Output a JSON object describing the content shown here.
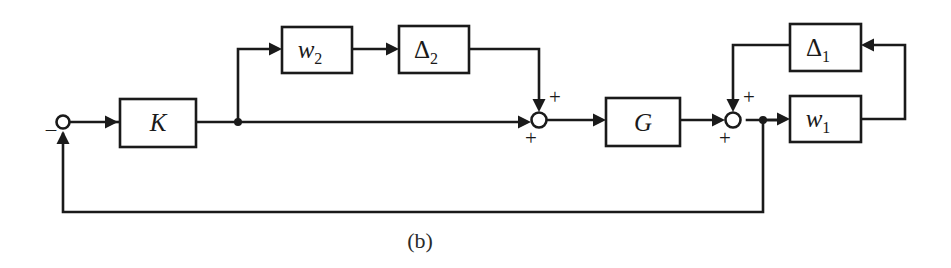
{
  "figure": {
    "caption": "(b)",
    "caption_x": 420,
    "caption_y": 248,
    "width": 951,
    "height": 268,
    "background_color": "#ffffff",
    "line_color": "#1a1a1a"
  },
  "blocks": [
    {
      "id": "controller",
      "name": "K",
      "label_main": "K",
      "label_sub": "",
      "italic": true,
      "x": 120,
      "y": 99,
      "w": 76,
      "h": 48,
      "label_x": 158,
      "label_y": 131
    },
    {
      "id": "weight2",
      "name": "w2",
      "label_main": "w",
      "label_sub": "2",
      "italic": true,
      "x": 282,
      "y": 27,
      "w": 70,
      "h": 46,
      "label_x": 310,
      "label_y": 58
    },
    {
      "id": "delta2",
      "name": "Delta2",
      "label_main": "Δ",
      "label_sub": "2",
      "italic": false,
      "x": 399,
      "y": 26,
      "w": 70,
      "h": 47,
      "label_x": 426,
      "label_y": 58
    },
    {
      "id": "plant",
      "name": "G",
      "label_main": "G",
      "label_sub": "",
      "italic": true,
      "x": 606,
      "y": 98,
      "w": 74,
      "h": 48,
      "label_x": 643,
      "label_y": 131
    },
    {
      "id": "delta1",
      "name": "Delta1",
      "label_main": "Δ",
      "label_sub": "1",
      "italic": false,
      "x": 790,
      "y": 24,
      "w": 71,
      "h": 47,
      "label_x": 818,
      "label_y": 56
    },
    {
      "id": "weight1",
      "name": "w1",
      "label_main": "w",
      "label_sub": "1",
      "italic": true,
      "x": 790,
      "y": 96,
      "w": 71,
      "h": 46,
      "label_x": 818,
      "label_y": 127
    }
  ],
  "summing_junctions": [
    {
      "id": "error-junction",
      "name": "error-summing-junction",
      "cx": 63,
      "cy": 122,
      "r": 6.5,
      "signs": [
        {
          "text": "–",
          "x": 51,
          "y": 136
        }
      ]
    },
    {
      "id": "sum-1",
      "name": "input-uncertainty-summing-junction",
      "cx": 539,
      "cy": 120,
      "r": 7.5,
      "signs": [
        {
          "text": "+",
          "x": 555,
          "y": 104
        },
        {
          "text": "+",
          "x": 531,
          "y": 145
        }
      ]
    },
    {
      "id": "sum-2",
      "name": "output-uncertainty-summing-junction",
      "cx": 733,
      "cy": 120,
      "r": 7.5,
      "signs": [
        {
          "text": "+",
          "x": 749,
          "y": 104
        },
        {
          "text": "+",
          "x": 725,
          "y": 145
        }
      ]
    }
  ],
  "branch_points": [
    {
      "id": "k-output-branch",
      "name": "controller-output-branch",
      "cx": 238,
      "cy": 122,
      "r": 4
    },
    {
      "id": "plant-output-branch",
      "name": "plant-output-branch",
      "cx": 763,
      "cy": 120,
      "r": 4
    }
  ],
  "wires": [
    {
      "id": "ref-to-junction",
      "name": "reference-input-wire",
      "d": "M 63 122 L 110 122"
    },
    {
      "id": "junction-to-k",
      "name": "error-to-controller-wire",
      "d": "M 110 122 L 118 122"
    },
    {
      "id": "k-to-branch",
      "name": "controller-output-wire",
      "d": "M 196 122 L 238 122"
    },
    {
      "id": "branch-to-w2",
      "name": "controller-branch-to-w2-wire",
      "d": "M 238 122 L 238 49 L 272 49"
    },
    {
      "id": "w2-to-delta2",
      "name": "w2-to-delta2-wire",
      "d": "M 352 49 L 389 49"
    },
    {
      "id": "delta2-to-sum1",
      "name": "delta2-to-sum1-wire",
      "d": "M 469 49 L 539 49 L 539 100"
    },
    {
      "id": "branch-to-sum1",
      "name": "controller-branch-to-sum1-wire",
      "d": "M 238 122 L 521 122"
    },
    {
      "id": "sum1-to-g",
      "name": "sum1-to-plant-wire",
      "d": "M 547 120 L 596 120"
    },
    {
      "id": "g-to-sum2",
      "name": "plant-to-sum2-wire",
      "d": "M 680 120 L 715 120"
    },
    {
      "id": "delta1-to-sum2",
      "name": "delta1-to-sum2-wire",
      "d": "M 790 45 L 733 45 L 733 100"
    },
    {
      "id": "sum2-to-branch",
      "name": "sum2-output-wire",
      "d": "M 747 120 L 780 120"
    },
    {
      "id": "branch-to-w1",
      "name": "output-branch-to-w1-wire",
      "d": "M 763 120 L 780 120"
    },
    {
      "id": "w1-to-delta1",
      "name": "w1-to-delta1-feedback-wire",
      "d": "M 861 119 L 905 119 L 905 45 L 872 45"
    },
    {
      "id": "output-feedback",
      "name": "output-feedback-wire",
      "d": "M 763 120 L 763 212 L 63 212 L 63 134"
    }
  ],
  "arrowheads": [
    {
      "id": "arrow-k-in",
      "name": "controller-input-arrowhead",
      "x": 118,
      "y": 122,
      "dir": "right"
    },
    {
      "id": "arrow-w2-in",
      "name": "w2-input-arrowhead",
      "x": 282,
      "y": 49,
      "dir": "right"
    },
    {
      "id": "arrow-delta2-in",
      "name": "delta2-input-arrowhead",
      "x": 399,
      "y": 49,
      "dir": "right"
    },
    {
      "id": "arrow-sum1-top",
      "name": "sum1-top-input-arrowhead",
      "x": 539,
      "y": 112,
      "dir": "down"
    },
    {
      "id": "arrow-sum1-left",
      "name": "sum1-left-input-arrowhead",
      "x": 531,
      "y": 122,
      "dir": "right"
    },
    {
      "id": "arrow-g-in",
      "name": "plant-input-arrowhead",
      "x": 606,
      "y": 120,
      "dir": "right"
    },
    {
      "id": "arrow-sum2-top",
      "name": "sum2-top-input-arrowhead",
      "x": 733,
      "y": 112,
      "dir": "down"
    },
    {
      "id": "arrow-sum2-left",
      "name": "sum2-left-input-arrowhead",
      "x": 725,
      "y": 120,
      "dir": "right"
    },
    {
      "id": "arrow-w1-in",
      "name": "w1-input-arrowhead",
      "x": 790,
      "y": 119,
      "dir": "right"
    },
    {
      "id": "arrow-delta1-in",
      "name": "delta1-input-arrowhead",
      "x": 861,
      "y": 45,
      "dir": "left"
    },
    {
      "id": "arrow-error-in",
      "name": "error-junction-feedback-arrowhead",
      "x": 63,
      "y": 131,
      "dir": "up"
    }
  ]
}
